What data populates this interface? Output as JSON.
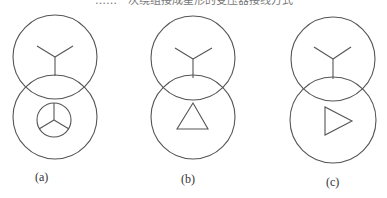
{
  "caption": "……一次绕组接成星形的变压器接线方式",
  "colors": {
    "stroke": "#555555",
    "background": "#ffffff",
    "label": "#333333"
  },
  "diagrams": [
    {
      "id": "a",
      "label": "(a)",
      "primary_symbol": "wye",
      "secondary_symbol": "wye-grounded-circle",
      "top_circle": {
        "cx": 55,
        "cy": 57,
        "r": 42
      },
      "bottom_circle": {
        "cx": 55,
        "cy": 117,
        "r": 42
      }
    },
    {
      "id": "b",
      "label": "(b)",
      "primary_symbol": "wye",
      "secondary_symbol": "delta",
      "top_circle": {
        "cx": 193,
        "cy": 58,
        "r": 42
      },
      "bottom_circle": {
        "cx": 193,
        "cy": 117,
        "r": 42
      }
    },
    {
      "id": "c",
      "label": "(c)",
      "primary_symbol": "wye",
      "secondary_symbol": "open-delta-triangle-right",
      "top_circle": {
        "cx": 333,
        "cy": 59,
        "r": 42
      },
      "bottom_circle": {
        "cx": 333,
        "cy": 120,
        "r": 43
      }
    }
  ]
}
